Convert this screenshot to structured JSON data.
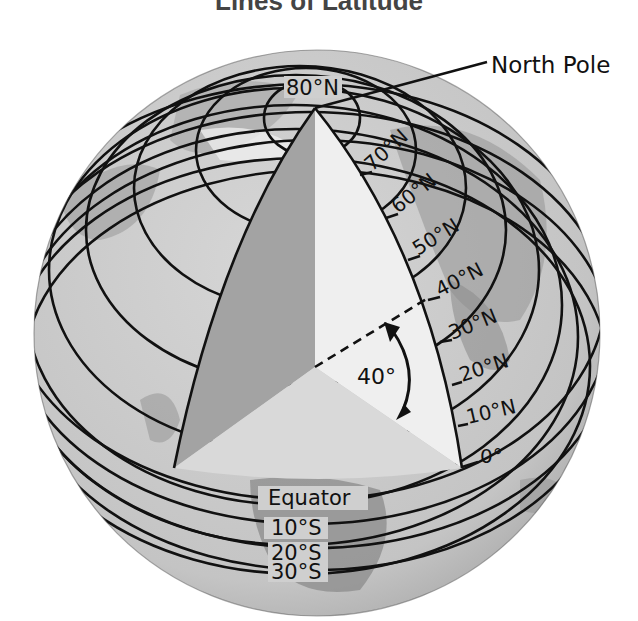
{
  "title": "Lines of Latitude",
  "labels": {
    "north_pole": "North Pole",
    "equator": "Equator",
    "angle": "40°"
  },
  "latitudes_north": [
    {
      "label": "80°N",
      "deg": 80
    },
    {
      "label": "70°N",
      "deg": 70
    },
    {
      "label": "60°N",
      "deg": 60
    },
    {
      "label": "50°N",
      "deg": 50
    },
    {
      "label": "40°N",
      "deg": 40
    },
    {
      "label": "30°N",
      "deg": 30
    },
    {
      "label": "20°N",
      "deg": 20
    },
    {
      "label": "10°N",
      "deg": 10
    },
    {
      "label": "0°",
      "deg": 0
    }
  ],
  "latitudes_south": [
    {
      "label": "10°S",
      "deg": -10
    },
    {
      "label": "20°S",
      "deg": -20
    },
    {
      "label": "30°S",
      "deg": -30
    }
  ],
  "colors": {
    "globe": "#c9c9c9",
    "land": "#9a9a9a",
    "wedge_dark": "#a3a3a3",
    "wedge_light": "#ececec",
    "wedge_floor": "#d8d8d8",
    "line": "#111111"
  }
}
